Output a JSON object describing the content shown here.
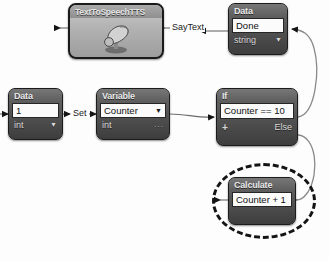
{
  "diagram": {
    "background_color": "#fdfdfd",
    "wire_color": "#6b6b6b",
    "node_border_color": "#1c1c1c",
    "highlight_color": "#141414"
  },
  "nodes": {
    "tts": {
      "header": "TextToSpeechTTS",
      "icon": "megaphone-icon"
    },
    "data_top": {
      "header": "Data",
      "value": "Done",
      "type": "string",
      "type_caret": "▼"
    },
    "data_left": {
      "header": "Data",
      "value": "1",
      "type": "int",
      "type_caret": "▼"
    },
    "variable": {
      "header": "Variable",
      "value": "Counter",
      "value_caret": "▼",
      "type": "int",
      "overflow": "..."
    },
    "if": {
      "header": "If",
      "condition": "Counter == 10",
      "add_branch": "+",
      "else_label": "Else"
    },
    "calculate": {
      "header": "Calculate",
      "expression": "Counter + 1"
    }
  },
  "edges": {
    "saytext_label": "SayText",
    "set_label": "Set"
  }
}
